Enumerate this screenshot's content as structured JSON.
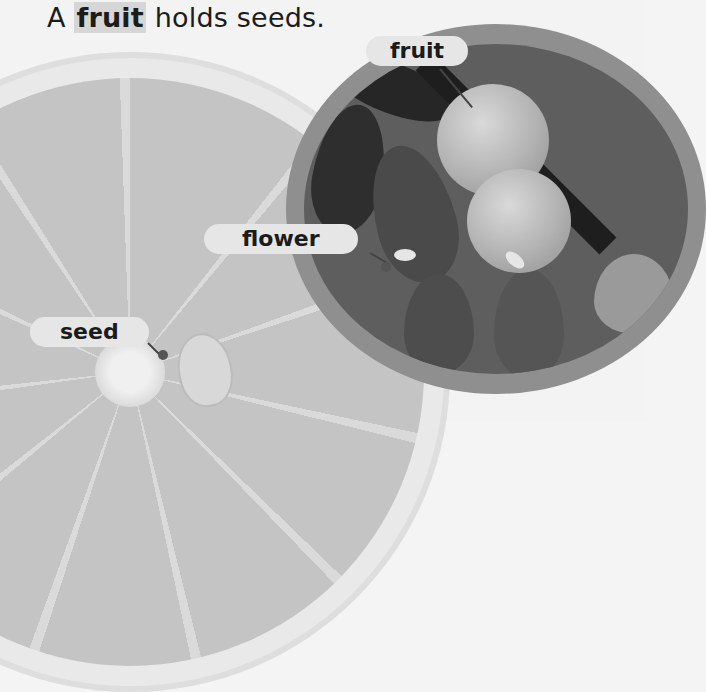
{
  "heading": {
    "prefix": "A ",
    "keyword": "fruit",
    "suffix": " holds seeds."
  },
  "labels": {
    "fruit": "fruit",
    "flower": "flower",
    "seed": "seed"
  },
  "images": {
    "lemon_slice": "lemon cross-section",
    "inset_photo": "lemon tree branch with fruit, leaves and flowers"
  },
  "colors": {
    "label_bg": "#e6e6e6",
    "label_text": "#1b1b1b",
    "inset_ring": "#8f8f8f",
    "keyword_highlight": "#d6d6d6"
  }
}
